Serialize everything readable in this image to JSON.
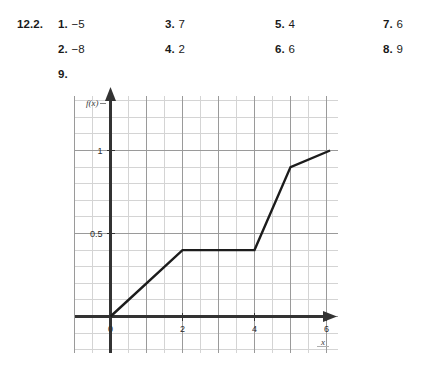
{
  "answer_key": {
    "section_label": "12.2.",
    "items": [
      {
        "number": "1.",
        "value": "−5",
        "col": 1,
        "row": 1
      },
      {
        "number": "2.",
        "value": "−8",
        "col": 1,
        "row": 2
      },
      {
        "number": "3.",
        "value": "7",
        "col": 2,
        "row": 1
      },
      {
        "number": "4.",
        "value": "2",
        "col": 2,
        "row": 2
      },
      {
        "number": "5.",
        "value": "4",
        "col": 3,
        "row": 1
      },
      {
        "number": "6.",
        "value": "6",
        "col": 3,
        "row": 2
      },
      {
        "number": "7.",
        "value": "6",
        "col": 4,
        "row": 1
      },
      {
        "number": "8.",
        "value": "9",
        "col": 4,
        "row": 2
      }
    ],
    "graph_item_number": "9."
  },
  "chart_data": {
    "type": "line",
    "title": "",
    "xlabel": "x",
    "ylabel": "f(x)",
    "xlim": [
      -1,
      6.3
    ],
    "ylim": [
      -0.3,
      1.35
    ],
    "xticks": [
      0,
      2,
      4,
      6
    ],
    "xtick_labels": [
      "0",
      "2",
      "4",
      "6"
    ],
    "yticks": [
      0.5,
      1
    ],
    "ytick_labels": [
      "0.5",
      "1"
    ],
    "grid": true,
    "grid_major_step_x": 1,
    "grid_minor_step_x": 0.5,
    "grid_major_step_y": 0.5,
    "grid_minor_step_y": 0.1,
    "legend": "none",
    "series": [
      {
        "name": "f(x)",
        "points": [
          {
            "x": 0,
            "y": 0.0
          },
          {
            "x": 2,
            "y": 0.4
          },
          {
            "x": 4,
            "y": 0.4
          },
          {
            "x": 5,
            "y": 0.9
          },
          {
            "x": 6.1,
            "y": 1.0
          }
        ]
      }
    ],
    "colors": {
      "curve": "#1c1c1c",
      "axis": "#333333",
      "grid_major": "#9a9a9a",
      "grid_minor": "#d4d4d4",
      "background": "#ffffff"
    }
  }
}
